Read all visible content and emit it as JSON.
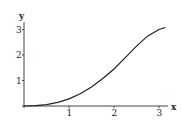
{
  "chart_data": {
    "type": "line",
    "title": "",
    "xlabel": "x",
    "ylabel": "y",
    "xlim": [
      0,
      3.3
    ],
    "ylim": [
      0,
      3.2
    ],
    "x_ticks": [
      "1",
      "2",
      "3"
    ],
    "y_ticks": [
      "1",
      "2",
      "3"
    ],
    "grid": false,
    "legend": null,
    "series": [
      {
        "name": "curve",
        "x": [
          0,
          0.25,
          0.5,
          0.75,
          1.0,
          1.25,
          1.5,
          1.75,
          2.0,
          2.25,
          2.5,
          2.75,
          3.0,
          3.14
        ],
        "values": [
          0,
          0.01,
          0.05,
          0.14,
          0.28,
          0.48,
          0.75,
          1.08,
          1.45,
          1.9,
          2.35,
          2.75,
          3.0,
          3.08
        ]
      }
    ],
    "color": "#222222"
  }
}
